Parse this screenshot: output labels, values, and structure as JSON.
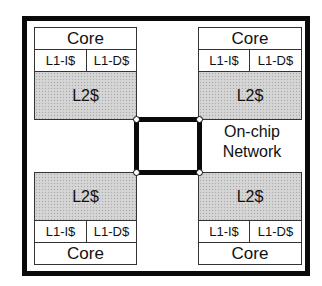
{
  "diagram": {
    "title": "",
    "tiles": [
      {
        "position": "top-left",
        "core": "Core",
        "l1_icache": "L1-I$",
        "l1_dcache": "L1-D$",
        "l2_cache": "L2$"
      },
      {
        "position": "top-right",
        "core": "Core",
        "l1_icache": "L1-I$",
        "l1_dcache": "L1-D$",
        "l2_cache": "L2$"
      },
      {
        "position": "bottom-left",
        "core": "Core",
        "l1_icache": "L1-I$",
        "l1_dcache": "L1-D$",
        "l2_cache": "L2$"
      },
      {
        "position": "bottom-right",
        "core": "Core",
        "l1_icache": "L1-I$",
        "l1_dcache": "L1-D$",
        "l2_cache": "L2$"
      }
    ],
    "network": {
      "label_line1": "On-chip",
      "label_line2": "Network",
      "topology": "ring connecting 4 L2 caches"
    },
    "colors": {
      "border": "#0a0a0a",
      "l2_fill": "#d2d2d2",
      "background": "#ffffff"
    }
  }
}
